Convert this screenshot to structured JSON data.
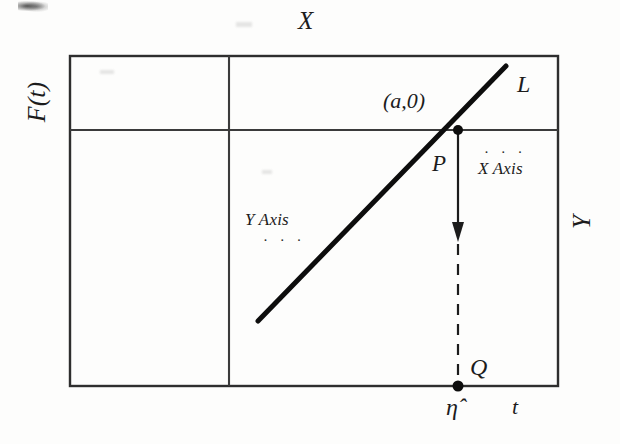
{
  "figure": {
    "type": "geometric-diagram",
    "labels": {
      "left_axis": "F(t)",
      "top_axis": "X",
      "right_axis": "Y",
      "bottom_axis": "t",
      "line_name": "L",
      "point_coordinate": "(a,0)",
      "point_on_line": "P",
      "point_on_bottom": "Q",
      "foot_value": "η̂",
      "x_axis_note": "X Axis",
      "y_axis_note": "Y Axis",
      "note_dots": "· · ·"
    }
  },
  "geometry": {
    "frame": {
      "left": 70,
      "top": 56,
      "right": 558,
      "bottom": 386
    },
    "vertical_rule_x": 229,
    "horizontal_rule_y": 130,
    "line_L": {
      "x1": 258,
      "y1": 321,
      "x2": 506,
      "y2": 66
    },
    "point_P": {
      "x": 458,
      "y": 130
    },
    "point_Q": {
      "x": 458,
      "y": 386
    },
    "arrow_tip": {
      "x": 458,
      "y": 236
    }
  },
  "colors": {
    "ink": "#1c1c1c",
    "rule": "#3a3a3a",
    "paper": "#fdfdfc"
  }
}
